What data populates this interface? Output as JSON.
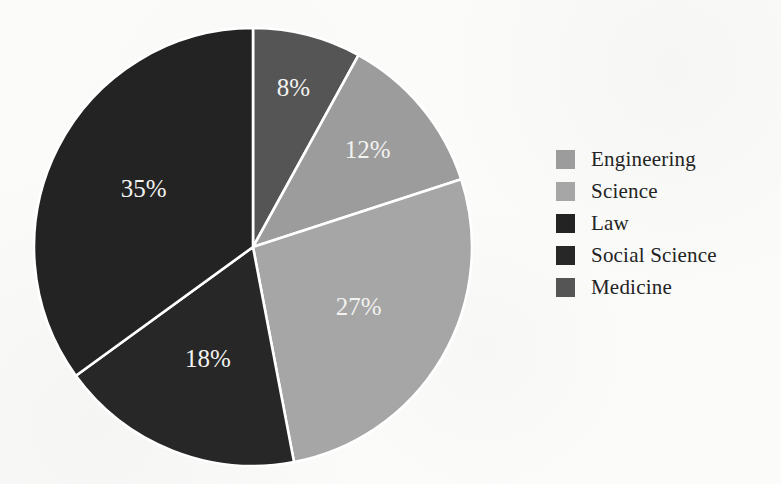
{
  "chart_data": {
    "type": "pie",
    "title": "",
    "subtitle": "",
    "xlabel": "",
    "ylabel": "",
    "legend_position": "right",
    "grid": false,
    "start_angle_deg": 0,
    "direction": "clockwise",
    "categories": [
      "Medicine",
      "Engineering",
      "Science",
      "Social Science",
      "Law"
    ],
    "values": [
      8,
      12,
      27,
      18,
      35
    ],
    "value_unit": "%",
    "data_labels": [
      "8%",
      "12%",
      "27%",
      "18%",
      "35%"
    ],
    "slice_colors": [
      "#555555",
      "#9c9c9c",
      "#a6a6a6",
      "#272727",
      "#232323"
    ],
    "slices": [
      {
        "label": "Medicine",
        "value": 8,
        "data_label": "8%",
        "color": "#555555"
      },
      {
        "label": "Engineering",
        "value": 12,
        "data_label": "12%",
        "color": "#9c9c9c"
      },
      {
        "label": "Science",
        "value": 27,
        "data_label": "27%",
        "color": "#a6a6a6"
      },
      {
        "label": "Social Science",
        "value": 18,
        "data_label": "18%",
        "color": "#272727"
      },
      {
        "label": "Law",
        "value": 35,
        "data_label": "35%",
        "color": "#232323"
      }
    ]
  },
  "pie": {
    "labels": {
      "medicine": "8%",
      "engineering": "12%",
      "science": "27%",
      "social_science": "18%",
      "law": "35%"
    },
    "label_color": "#f2f2f0",
    "separator_color": "#ffffff"
  },
  "legend": {
    "items": [
      {
        "label": "Engineering",
        "color": "#9c9c9c"
      },
      {
        "label": "Science",
        "color": "#a6a6a6"
      },
      {
        "label": "Law",
        "color": "#232323"
      },
      {
        "label": "Social Science",
        "color": "#272727"
      },
      {
        "label": "Medicine",
        "color": "#555555"
      }
    ]
  },
  "page": {
    "background": "#fbfbfa",
    "text_color": "#232323"
  }
}
